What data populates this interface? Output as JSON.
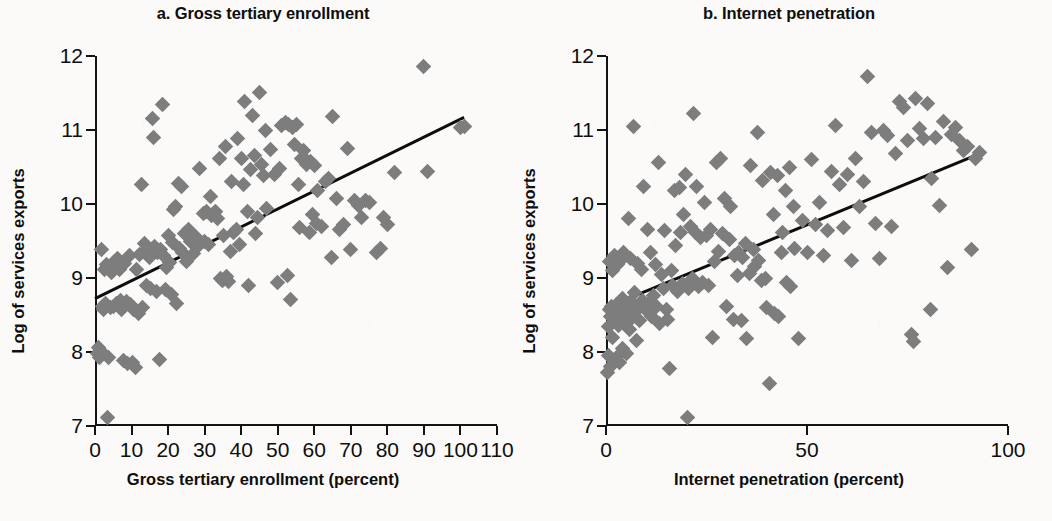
{
  "figure": {
    "background_color": "#fbfaf8",
    "marker_color": "#7d7d7d",
    "axis_color": "#141414",
    "trendline_color": "#0d0d0d"
  },
  "chart_data": [
    {
      "type": "scatter",
      "title": "a. Gross tertiary enrollment",
      "xlabel": "Gross tertiary enrollment (percent)",
      "ylabel": "Log of services exports",
      "xlim": [
        0,
        110
      ],
      "ylim": [
        7,
        12
      ],
      "xticks": [
        0,
        10,
        20,
        30,
        40,
        50,
        60,
        70,
        80,
        90,
        100,
        110
      ],
      "xticklabels": [
        "0",
        "10",
        "20",
        "30",
        "40",
        "50",
        "60",
        "70",
        "80",
        "90",
        "100",
        "110"
      ],
      "yticks": [
        7,
        8,
        9,
        10,
        11,
        12
      ],
      "yticklabels": [
        "7",
        "8",
        "9",
        "10",
        "11",
        "12"
      ],
      "grid": false,
      "legend": "none",
      "trendline": {
        "x0": 0,
        "y0": 8.72,
        "x1": 101,
        "y1": 11.17
      },
      "points": [
        [
          0.8,
          7.98
        ],
        [
          1.0,
          8.06
        ],
        [
          1.2,
          7.93
        ],
        [
          1.5,
          8.02
        ],
        [
          1.8,
          9.38
        ],
        [
          2.0,
          8.62
        ],
        [
          2.4,
          8.57
        ],
        [
          2.6,
          9.12
        ],
        [
          3.0,
          8.66
        ],
        [
          3.2,
          9.18
        ],
        [
          3.5,
          7.12
        ],
        [
          3.8,
          7.92
        ],
        [
          4.2,
          8.6
        ],
        [
          4.6,
          9.08
        ],
        [
          5.0,
          8.62
        ],
        [
          5.3,
          9.22
        ],
        [
          5.8,
          8.66
        ],
        [
          6.2,
          9.26
        ],
        [
          6.6,
          9.12
        ],
        [
          7.0,
          8.7
        ],
        [
          7.3,
          8.58
        ],
        [
          7.8,
          7.88
        ],
        [
          8.2,
          9.2
        ],
        [
          8.6,
          8.68
        ],
        [
          9.0,
          7.85
        ],
        [
          9.4,
          9.3
        ],
        [
          9.8,
          8.64
        ],
        [
          10.2,
          7.86
        ],
        [
          10.6,
          8.58
        ],
        [
          11.0,
          7.79
        ],
        [
          11.4,
          9.12
        ],
        [
          11.8,
          8.52
        ],
        [
          12.2,
          9.32
        ],
        [
          12.6,
          10.26
        ],
        [
          13.0,
          8.6
        ],
        [
          13.5,
          9.46
        ],
        [
          14.0,
          8.9
        ],
        [
          14.4,
          9.4
        ],
        [
          14.8,
          9.28
        ],
        [
          15.2,
          8.86
        ],
        [
          15.6,
          11.16
        ],
        [
          16.0,
          10.9
        ],
        [
          16.4,
          9.42
        ],
        [
          16.8,
          8.82
        ],
        [
          17.2,
          9.35
        ],
        [
          17.6,
          7.9
        ],
        [
          18.0,
          9.38
        ],
        [
          18.4,
          11.34
        ],
        [
          18.8,
          9.3
        ],
        [
          19.2,
          8.84
        ],
        [
          19.6,
          9.14
        ],
        [
          20.0,
          9.58
        ],
        [
          20.4,
          9.21
        ],
        [
          20.8,
          8.78
        ],
        [
          21.2,
          9.48
        ],
        [
          21.6,
          9.92
        ],
        [
          22.0,
          9.96
        ],
        [
          22.4,
          8.66
        ],
        [
          22.8,
          10.28
        ],
        [
          23.2,
          9.4
        ],
        [
          23.6,
          10.23
        ],
        [
          24.0,
          9.34
        ],
        [
          24.4,
          9.6
        ],
        [
          25.0,
          9.22
        ],
        [
          25.6,
          9.66
        ],
        [
          26.0,
          9.5
        ],
        [
          26.6,
          9.48
        ],
        [
          27.0,
          9.33
        ],
        [
          27.6,
          9.56
        ],
        [
          28.0,
          9.42
        ],
        [
          28.6,
          10.48
        ],
        [
          29.0,
          9.46
        ],
        [
          29.6,
          9.87
        ],
        [
          30.0,
          9.5
        ],
        [
          30.6,
          9.9
        ],
        [
          31.0,
          9.45
        ],
        [
          31.6,
          10.1
        ],
        [
          32.0,
          9.85
        ],
        [
          32.6,
          9.88
        ],
        [
          33.0,
          9.9
        ],
        [
          33.6,
          9.8
        ],
        [
          34.0,
          10.62
        ],
        [
          34.4,
          9.0
        ],
        [
          34.8,
          8.96
        ],
        [
          35.2,
          9.58
        ],
        [
          35.6,
          10.78
        ],
        [
          36.0,
          9.02
        ],
        [
          36.4,
          8.95
        ],
        [
          37.0,
          9.36
        ],
        [
          37.4,
          10.3
        ],
        [
          38.0,
          9.62
        ],
        [
          38.6,
          9.66
        ],
        [
          39.0,
          10.88
        ],
        [
          39.6,
          9.45
        ],
        [
          40.0,
          10.62
        ],
        [
          40.6,
          10.26
        ],
        [
          41.0,
          11.38
        ],
        [
          41.6,
          9.9
        ],
        [
          42.0,
          8.9
        ],
        [
          42.6,
          10.46
        ],
        [
          43.0,
          11.19
        ],
        [
          43.6,
          10.66
        ],
        [
          44.0,
          9.6
        ],
        [
          44.6,
          9.82
        ],
        [
          45.0,
          11.51
        ],
        [
          45.6,
          10.54
        ],
        [
          46.0,
          10.38
        ],
        [
          46.6,
          11.0
        ],
        [
          47.0,
          9.94
        ],
        [
          48.0,
          10.74
        ],
        [
          49.0,
          10.4
        ],
        [
          50.0,
          8.94
        ],
        [
          50.6,
          10.48
        ],
        [
          51.0,
          11.06
        ],
        [
          52.0,
          11.1
        ],
        [
          52.6,
          9.04
        ],
        [
          53.0,
          11.07
        ],
        [
          53.6,
          8.71
        ],
        [
          54.0,
          11.04
        ],
        [
          54.6,
          10.8
        ],
        [
          55.0,
          11.08
        ],
        [
          55.6,
          10.26
        ],
        [
          56.0,
          9.68
        ],
        [
          56.6,
          10.62
        ],
        [
          57.0,
          10.72
        ],
        [
          57.6,
          10.6
        ],
        [
          58.0,
          10.54
        ],
        [
          58.6,
          9.62
        ],
        [
          59.0,
          10.58
        ],
        [
          59.6,
          9.86
        ],
        [
          60.0,
          10.52
        ],
        [
          60.6,
          9.74
        ],
        [
          61.0,
          10.18
        ],
        [
          62.0,
          9.7
        ],
        [
          63.0,
          10.3
        ],
        [
          64.0,
          10.34
        ],
        [
          64.6,
          9.28
        ],
        [
          65.0,
          11.18
        ],
        [
          66.0,
          10.08
        ],
        [
          67.0,
          9.66
        ],
        [
          68.0,
          9.72
        ],
        [
          69.0,
          10.75
        ],
        [
          70.0,
          9.38
        ],
        [
          71.0,
          10.05
        ],
        [
          72.0,
          9.98
        ],
        [
          73.0,
          9.82
        ],
        [
          74.0,
          10.05
        ],
        [
          75.0,
          10.02
        ],
        [
          77.0,
          9.34
        ],
        [
          78.0,
          9.4
        ],
        [
          79.0,
          9.82
        ],
        [
          80.0,
          9.72
        ],
        [
          82.0,
          10.42
        ],
        [
          90.0,
          11.86
        ],
        [
          91.0,
          10.44
        ],
        [
          100.0,
          11.03
        ],
        [
          101.0,
          11.05
        ]
      ]
    },
    {
      "type": "scatter",
      "title": "b. Internet penetration",
      "xlabel": "Internet penetration (percent)",
      "ylabel": "Log of services exports",
      "xlim": [
        0,
        100
      ],
      "ylim": [
        7,
        12
      ],
      "xticks": [
        0,
        50,
        100
      ],
      "xticklabels": [
        "0",
        "50",
        "100"
      ],
      "yticks": [
        7,
        8,
        9,
        10,
        11,
        12
      ],
      "yticklabels": [
        "7",
        "8",
        "9",
        "10",
        "11",
        "12"
      ],
      "grid": false,
      "legend": "none",
      "trendline": {
        "x0": 0,
        "y0": 8.6,
        "x1": 93,
        "y1": 10.68
      },
      "points": [
        [
          0.3,
          7.72
        ],
        [
          0.5,
          7.95
        ],
        [
          0.6,
          8.35
        ],
        [
          0.8,
          8.58
        ],
        [
          0.9,
          9.22
        ],
        [
          1.0,
          7.8
        ],
        [
          1.2,
          8.48
        ],
        [
          1.3,
          8.62
        ],
        [
          1.5,
          9.1
        ],
        [
          1.6,
          8.2
        ],
        [
          1.8,
          7.88
        ],
        [
          2.0,
          8.55
        ],
        [
          2.1,
          9.3
        ],
        [
          2.3,
          8.44
        ],
        [
          2.5,
          7.92
        ],
        [
          2.6,
          8.64
        ],
        [
          2.8,
          9.18
        ],
        [
          3.0,
          8.36
        ],
        [
          3.2,
          8.6
        ],
        [
          3.4,
          7.86
        ],
        [
          3.6,
          9.24
        ],
        [
          3.8,
          8.52
        ],
        [
          4.0,
          8.05
        ],
        [
          4.2,
          8.72
        ],
        [
          4.4,
          9.34
        ],
        [
          4.6,
          8.4
        ],
        [
          4.8,
          8.66
        ],
        [
          5.0,
          7.98
        ],
        [
          5.2,
          8.58
        ],
        [
          5.5,
          9.8
        ],
        [
          5.8,
          8.3
        ],
        [
          6.0,
          8.68
        ],
        [
          6.2,
          9.26
        ],
        [
          6.5,
          8.46
        ],
        [
          6.8,
          11.05
        ],
        [
          7.0,
          8.54
        ],
        [
          7.2,
          8.8
        ],
        [
          7.5,
          8.16
        ],
        [
          7.8,
          9.2
        ],
        [
          8.0,
          8.62
        ],
        [
          8.4,
          8.42
        ],
        [
          8.8,
          9.12
        ],
        [
          9.0,
          8.7
        ],
        [
          9.4,
          10.23
        ],
        [
          9.8,
          8.58
        ],
        [
          10.2,
          9.66
        ],
        [
          10.6,
          8.66
        ],
        [
          11.0,
          9.35
        ],
        [
          11.4,
          8.48
        ],
        [
          11.8,
          8.76
        ],
        [
          12.2,
          9.18
        ],
        [
          12.6,
          8.62
        ],
        [
          13.0,
          10.56
        ],
        [
          13.4,
          8.38
        ],
        [
          13.8,
          9.05
        ],
        [
          14.2,
          8.86
        ],
        [
          14.6,
          9.64
        ],
        [
          15.0,
          8.58
        ],
        [
          15.4,
          8.44
        ],
        [
          15.8,
          7.78
        ],
        [
          16.2,
          9.1
        ],
        [
          16.6,
          8.9
        ],
        [
          17.0,
          10.18
        ],
        [
          17.4,
          9.44
        ],
        [
          17.8,
          8.82
        ],
        [
          18.2,
          10.22
        ],
        [
          18.6,
          9.62
        ],
        [
          19.0,
          8.92
        ],
        [
          19.4,
          9.86
        ],
        [
          19.8,
          10.4
        ],
        [
          20.2,
          7.12
        ],
        [
          20.6,
          8.86
        ],
        [
          21.0,
          9.7
        ],
        [
          21.4,
          9.0
        ],
        [
          21.8,
          11.22
        ],
        [
          22.2,
          9.62
        ],
        [
          22.6,
          10.24
        ],
        [
          23.0,
          8.88
        ],
        [
          23.6,
          9.55
        ],
        [
          24.0,
          8.94
        ],
        [
          24.6,
          10.02
        ],
        [
          25.0,
          9.58
        ],
        [
          25.6,
          8.9
        ],
        [
          26.0,
          9.66
        ],
        [
          26.6,
          8.2
        ],
        [
          27.0,
          9.22
        ],
        [
          27.6,
          10.56
        ],
        [
          28.0,
          9.36
        ],
        [
          28.6,
          10.62
        ],
        [
          29.0,
          9.6
        ],
        [
          29.6,
          10.08
        ],
        [
          30.0,
          8.62
        ],
        [
          30.6,
          9.52
        ],
        [
          31.0,
          9.96
        ],
        [
          31.6,
          8.44
        ],
        [
          32.0,
          9.3
        ],
        [
          32.6,
          9.04
        ],
        [
          33.0,
          9.34
        ],
        [
          33.6,
          8.42
        ],
        [
          34.0,
          9.28
        ],
        [
          34.6,
          9.46
        ],
        [
          35.0,
          8.18
        ],
        [
          35.6,
          9.06
        ],
        [
          36.0,
          10.52
        ],
        [
          36.6,
          9.38
        ],
        [
          37.0,
          9.16
        ],
        [
          37.6,
          10.96
        ],
        [
          38.0,
          9.24
        ],
        [
          38.6,
          8.96
        ],
        [
          39.0,
          10.32
        ],
        [
          39.6,
          9.0
        ],
        [
          40.0,
          8.6
        ],
        [
          40.6,
          7.58
        ],
        [
          41.0,
          10.42
        ],
        [
          41.6,
          9.86
        ],
        [
          42.0,
          8.52
        ],
        [
          42.6,
          10.38
        ],
        [
          43.0,
          8.48
        ],
        [
          43.6,
          9.34
        ],
        [
          44.0,
          9.62
        ],
        [
          44.6,
          10.18
        ],
        [
          45.0,
          8.94
        ],
        [
          45.6,
          10.5
        ],
        [
          46.0,
          8.88
        ],
        [
          46.6,
          9.96
        ],
        [
          47.0,
          9.4
        ],
        [
          48.0,
          8.18
        ],
        [
          49.0,
          9.78
        ],
        [
          50.0,
          9.34
        ],
        [
          51.0,
          10.6
        ],
        [
          52.0,
          9.72
        ],
        [
          53.0,
          10.02
        ],
        [
          54.0,
          9.3
        ],
        [
          55.0,
          9.64
        ],
        [
          56.0,
          10.44
        ],
        [
          57.0,
          11.06
        ],
        [
          58.0,
          10.26
        ],
        [
          59.0,
          9.68
        ],
        [
          60.0,
          10.4
        ],
        [
          61.0,
          9.24
        ],
        [
          62.0,
          10.62
        ],
        [
          63.0,
          9.96
        ],
        [
          64.0,
          10.3
        ],
        [
          65.0,
          11.72
        ],
        [
          66.0,
          10.96
        ],
        [
          67.0,
          9.74
        ],
        [
          68.0,
          9.26
        ],
        [
          69.0,
          11.0
        ],
        [
          70.0,
          10.92
        ],
        [
          71.0,
          9.7
        ],
        [
          72.0,
          10.68
        ],
        [
          73.0,
          11.38
        ],
        [
          74.0,
          11.3
        ],
        [
          75.0,
          10.86
        ],
        [
          76.0,
          8.24
        ],
        [
          76.6,
          8.14
        ],
        [
          77.0,
          11.42
        ],
        [
          78.0,
          11.02
        ],
        [
          79.0,
          10.88
        ],
        [
          80.0,
          11.36
        ],
        [
          80.6,
          8.58
        ],
        [
          81.0,
          10.34
        ],
        [
          82.0,
          10.9
        ],
        [
          83.0,
          9.98
        ],
        [
          84.0,
          11.12
        ],
        [
          85.0,
          9.14
        ],
        [
          86.0,
          10.94
        ],
        [
          87.0,
          11.04
        ],
        [
          88.0,
          10.86
        ],
        [
          89.0,
          10.72
        ],
        [
          90.0,
          10.78
        ],
        [
          91.0,
          9.38
        ],
        [
          92.0,
          10.62
        ],
        [
          93.0,
          10.7
        ]
      ]
    }
  ]
}
